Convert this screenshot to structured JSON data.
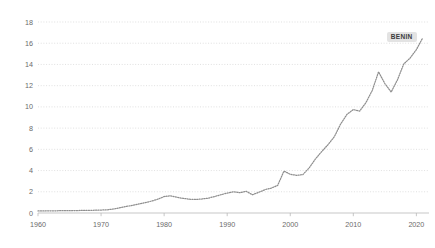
{
  "chart_data": {
    "type": "line",
    "title": "",
    "subtitle": "",
    "xlabel": "",
    "ylabel": "",
    "xlim": [
      1960,
      2022
    ],
    "ylim": [
      0,
      18
    ],
    "grid": true,
    "legend_position": "inline-end-label",
    "annotations": [
      {
        "name": "series-end-label",
        "text": "BENIN",
        "x": 2021,
        "y": 16.5
      }
    ],
    "x_ticks": [
      1960,
      1970,
      1980,
      1990,
      2000,
      2010,
      2020
    ],
    "x_tick_labels": [
      "1960",
      "1970",
      "1980",
      "1990",
      "2000",
      "2010",
      "2020"
    ],
    "y_ticks": [
      0,
      2,
      4,
      6,
      8,
      10,
      12,
      14,
      16,
      18
    ],
    "y_tick_labels": [
      "0",
      "2",
      "4",
      "6",
      "8",
      "10",
      "12",
      "14",
      "16",
      "18"
    ],
    "series": [
      {
        "name": "BENIN",
        "color": "#8e8e8e",
        "style": "dotted",
        "x": [
          1960,
          1961,
          1962,
          1963,
          1964,
          1965,
          1966,
          1967,
          1968,
          1969,
          1970,
          1971,
          1972,
          1973,
          1974,
          1975,
          1976,
          1977,
          1978,
          1979,
          1980,
          1981,
          1982,
          1983,
          1984,
          1985,
          1986,
          1987,
          1988,
          1989,
          1990,
          1991,
          1992,
          1993,
          1994,
          1995,
          1996,
          1997,
          1998,
          1999,
          2000,
          2001,
          2002,
          2003,
          2004,
          2005,
          2006,
          2007,
          2008,
          2009,
          2010,
          2011,
          2012,
          2013,
          2014,
          2015,
          2016,
          2017,
          2018,
          2019,
          2020,
          2021
        ],
        "values": [
          0.2,
          0.2,
          0.21,
          0.21,
          0.22,
          0.22,
          0.23,
          0.24,
          0.25,
          0.26,
          0.28,
          0.3,
          0.38,
          0.5,
          0.62,
          0.72,
          0.85,
          0.98,
          1.12,
          1.3,
          1.55,
          1.62,
          1.48,
          1.38,
          1.3,
          1.28,
          1.32,
          1.4,
          1.55,
          1.72,
          1.88,
          2.0,
          1.92,
          2.05,
          1.72,
          1.95,
          2.2,
          2.35,
          2.6,
          3.95,
          3.65,
          3.55,
          3.62,
          4.25,
          5.1,
          5.8,
          6.45,
          7.2,
          8.4,
          9.3,
          9.75,
          9.6,
          10.4,
          11.55,
          13.3,
          12.2,
          11.4,
          12.55,
          14.05,
          14.6,
          15.4,
          16.5
        ]
      }
    ]
  },
  "axis": {
    "y_axis_name": "y-axis",
    "x_axis_name": "x-axis"
  }
}
